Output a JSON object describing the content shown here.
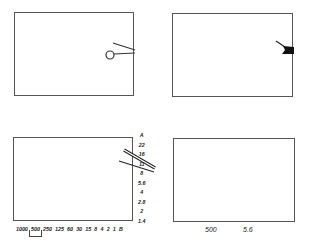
{
  "panels": [
    {
      "id": "top-left",
      "indicator": "needle-with-circle"
    },
    {
      "id": "top-right",
      "indicator": "needle-with-filled-flag"
    },
    {
      "id": "bottom-left",
      "indicator": "dual-needles-aperture-scale"
    },
    {
      "id": "bottom-right",
      "indicator": "digital-readout"
    }
  ],
  "aperture_scale": [
    "A",
    "22",
    "16",
    "11",
    "8",
    "5.6",
    "4",
    "2.8",
    "2",
    "1.4"
  ],
  "shutter_scale": [
    "1000",
    "500",
    "250",
    "125",
    "60",
    "30",
    "15",
    "8",
    "4",
    "2",
    "1",
    "B"
  ],
  "selected_shutter": "500",
  "readout": {
    "shutter": "500",
    "aperture": "5.6"
  }
}
